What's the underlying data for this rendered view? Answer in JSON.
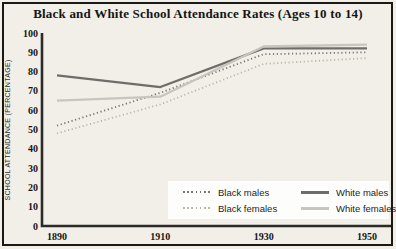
{
  "title": "Black and White School Attendance Rates (Ages 10 to 14)",
  "colors": {
    "background": "#f1efe8",
    "frame": "#191917",
    "axis": "#2a2a27",
    "legend_background": "#fdfdfc",
    "dark_gray_line": "#71706c",
    "light_gray_line": "#c7c5bf"
  },
  "chart_data": {
    "type": "line",
    "title": "Black and White School Attendance Rates (Ages 10 to 14)",
    "xlabel": "",
    "ylabel": "SCHOOL ATTENDANCE (PERCENTAGE)",
    "x": [
      1890,
      1910,
      1930,
      1950
    ],
    "x_tick_labels": [
      "1890",
      "1910",
      "1930",
      "1950"
    ],
    "y_ticks": [
      0,
      10,
      20,
      30,
      40,
      50,
      60,
      70,
      80,
      90,
      100
    ],
    "ylim": [
      0,
      100
    ],
    "grid": false,
    "legend_position": "inside-bottom-right",
    "series": [
      {
        "name": "Black males",
        "style": "dotted",
        "color": "#767571",
        "values": [
          52,
          69,
          89,
          90
        ]
      },
      {
        "name": "Black females",
        "style": "dotted",
        "color": "#b9b7b1",
        "values": [
          48,
          63,
          84,
          87
        ]
      },
      {
        "name": "White males",
        "style": "solid",
        "color": "#6e6d69",
        "values": [
          78,
          72,
          92,
          92
        ]
      },
      {
        "name": "White females",
        "style": "solid",
        "color": "#c7c5bf",
        "values": [
          65,
          67,
          93,
          94
        ]
      }
    ]
  }
}
